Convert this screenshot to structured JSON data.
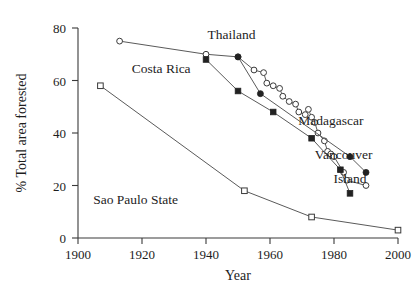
{
  "chart_data": {
    "type": "line",
    "title": "",
    "xlabel": "Year",
    "ylabel": "% Total area forested",
    "xlim": [
      1900,
      2000
    ],
    "ylim": [
      0,
      80
    ],
    "xticks": [
      1900,
      1920,
      1940,
      1960,
      1980,
      2000
    ],
    "yticks": [
      0,
      20,
      40,
      60,
      80
    ],
    "grid": false,
    "legend_position": "inline-annotations",
    "series": [
      {
        "name": "Costa Rica",
        "marker": "open-circle",
        "label_x": 1926,
        "label_y": 63,
        "points": [
          {
            "x": 1913,
            "y": 75
          },
          {
            "x": 1940,
            "y": 70
          },
          {
            "x": 1950,
            "y": 69
          },
          {
            "x": 1955,
            "y": 64
          },
          {
            "x": 1958,
            "y": 63
          },
          {
            "x": 1959,
            "y": 59
          },
          {
            "x": 1961,
            "y": 58
          },
          {
            "x": 1963,
            "y": 57
          },
          {
            "x": 1964,
            "y": 54
          },
          {
            "x": 1966,
            "y": 52
          },
          {
            "x": 1968,
            "y": 51
          },
          {
            "x": 1969,
            "y": 48
          },
          {
            "x": 1971,
            "y": 47
          },
          {
            "x": 1972,
            "y": 49
          },
          {
            "x": 1973,
            "y": 46
          },
          {
            "x": 1974,
            "y": 44
          },
          {
            "x": 1975,
            "y": 40
          },
          {
            "x": 1977,
            "y": 37
          },
          {
            "x": 1978,
            "y": 33
          },
          {
            "x": 1979,
            "y": 32
          },
          {
            "x": 1980,
            "y": 31
          },
          {
            "x": 1983,
            "y": 25
          },
          {
            "x": 1984,
            "y": 22
          },
          {
            "x": 1990,
            "y": 20
          }
        ]
      },
      {
        "name": "Thailand",
        "marker": "filled-square",
        "label_x": 1948,
        "label_y": 76,
        "points": [
          {
            "x": 1940,
            "y": 68
          },
          {
            "x": 1950,
            "y": 56
          },
          {
            "x": 1961,
            "y": 48
          },
          {
            "x": 1973,
            "y": 38
          },
          {
            "x": 1982,
            "y": 26
          },
          {
            "x": 1985,
            "y": 17
          }
        ]
      },
      {
        "name": "Madagascar",
        "marker": "filled-circle",
        "label_x": 1979,
        "label_y": 43,
        "points": [
          {
            "x": 1950,
            "y": 69
          },
          {
            "x": 1957,
            "y": 55
          },
          {
            "x": 1985,
            "y": 31
          },
          {
            "x": 1990,
            "y": 25
          }
        ]
      },
      {
        "name": "Vancouver Island",
        "marker": "filled-circle",
        "label_x": 1983,
        "label_y": 29,
        "label_line2": "Island",
        "points": []
      },
      {
        "name": "Sao Paulo State",
        "marker": "open-square",
        "label_x": 1920,
        "label_y": 13,
        "points": [
          {
            "x": 1907,
            "y": 58
          },
          {
            "x": 1952,
            "y": 18
          },
          {
            "x": 1973,
            "y": 8
          },
          {
            "x": 2000,
            "y": 3
          }
        ]
      }
    ],
    "annotations": [
      {
        "text": "Thailand",
        "x": 1948,
        "y": 76
      },
      {
        "text": "Costa Rica",
        "x": 1926,
        "y": 63
      },
      {
        "text": "Madagascar",
        "x": 1979,
        "y": 43
      },
      {
        "text": "Vancouver",
        "x": 1983,
        "y": 30
      },
      {
        "text": "Island",
        "x": 1985,
        "y": 21
      },
      {
        "text": "Sao Paulo State",
        "x": 1918,
        "y": 13
      }
    ]
  },
  "labels": {
    "thailand": "Thailand",
    "costa_rica": "Costa Rica",
    "madagascar": "Madagascar",
    "vancouver": "Vancouver",
    "island": "Island",
    "sao_paulo": "Sao Paulo State",
    "x_axis": "Year",
    "y_axis": "% Total area forested",
    "tick_0": "0",
    "tick_20": "20",
    "tick_40": "40",
    "tick_60": "60",
    "tick_80": "80",
    "tick_1900": "1900",
    "tick_1920": "1920",
    "tick_1940": "1940",
    "tick_1960": "1960",
    "tick_1980": "1980",
    "tick_2000": "2000"
  },
  "colors": {
    "axis": "#3a3a3a",
    "line": "#5a5a5a",
    "marker_fill": "#222222",
    "marker_open": "#ffffff",
    "background": "#ffffff",
    "text": "#1d1d1d"
  }
}
